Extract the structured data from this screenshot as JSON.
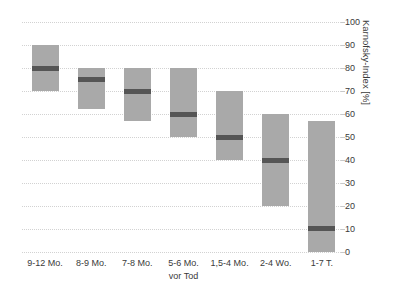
{
  "figure": {
    "title_remnant": "",
    "background_color": "#ffffff"
  },
  "chart_data": {
    "type": "bar",
    "subtype": "floating-range-bar-with-median",
    "title": "",
    "xlabel": "vor Tod",
    "ylabel": "Karnofsky-Index [%]",
    "ylim": [
      0,
      100
    ],
    "ytick_step": 10,
    "grid": true,
    "legend": null,
    "categories": [
      "9-12 Mo.",
      "8-9 Mo.",
      "7-8 Mo.",
      "5-6 Mo.",
      "1,5-4 Mo.",
      "2-4 Wo.",
      "1-7 T."
    ],
    "ytick_labels": [
      "0",
      "10",
      "20",
      "30",
      "40",
      "50",
      "60",
      "70",
      "80",
      "90",
      "100"
    ],
    "ytick_values": [
      0,
      10,
      20,
      30,
      40,
      50,
      60,
      70,
      80,
      90,
      100
    ],
    "series": [
      {
        "name": "Karnofsky-Index Bereich",
        "low": [
          70,
          62,
          57,
          50,
          40,
          20,
          0
        ],
        "high": [
          90,
          80,
          80,
          80,
          70,
          60,
          57
        ],
        "median": [
          80,
          75,
          70,
          60,
          50,
          40,
          10
        ]
      }
    ],
    "bars": [
      {
        "category": "9-12 Mo.",
        "low": 70,
        "high": 90,
        "median": 80
      },
      {
        "category": "8-9 Mo.",
        "low": 62,
        "high": 80,
        "median": 75
      },
      {
        "category": "7-8 Mo.",
        "low": 57,
        "high": 80,
        "median": 70
      },
      {
        "category": "5-6 Mo.",
        "low": 50,
        "high": 80,
        "median": 60
      },
      {
        "category": "1,5-4 Mo.",
        "low": 40,
        "high": 70,
        "median": 50
      },
      {
        "category": "2-4 Wo.",
        "low": 20,
        "high": 60,
        "median": 40
      },
      {
        "category": "1-7 T.",
        "low": 0,
        "high": 57,
        "median": 10
      }
    ],
    "colors": {
      "bar_fill": "#a9a9a9",
      "median_line": "#555555",
      "gridline": "#d2d2d2",
      "tick_text": "#3a3a3a"
    }
  }
}
